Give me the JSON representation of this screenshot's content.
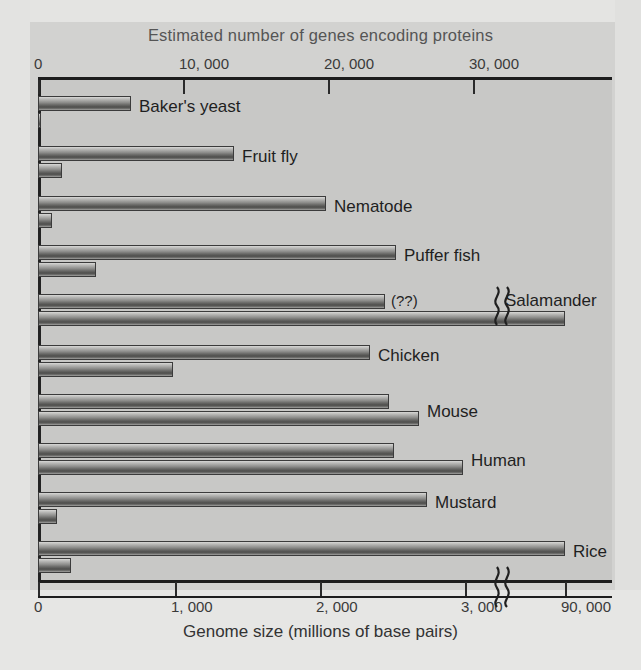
{
  "titles": {
    "top_axis_title": "Estimated number of genes encoding proteins",
    "bottom_axis_title": "Genome size (millions of base pairs)"
  },
  "chart_data": {
    "type": "bar",
    "orientation": "horizontal",
    "title": "",
    "grid": false,
    "legend": "none",
    "top_axis": {
      "label": "Estimated number of genes encoding proteins",
      "ticks": [
        "0",
        "10, 000",
        "20, 000",
        "30, 000"
      ],
      "tick_values": [
        0,
        10000,
        20000,
        30000
      ],
      "range": [
        0,
        39500
      ],
      "units": "genes"
    },
    "bottom_axis": {
      "label": "Genome size (millions of base pairs)",
      "ticks": [
        "0",
        "1, 000",
        "2, 000",
        "3, 000",
        "90, 000"
      ],
      "tick_values": [
        0,
        1000,
        2000,
        3000,
        90000
      ],
      "range": [
        0,
        3200
      ],
      "units": "millions of base pairs",
      "has_axis_break": true,
      "break_after": 3200
    },
    "categories": [
      "Baker's yeast",
      "Fruit fly",
      "Nematode",
      "Puffer fish",
      "Salamander",
      "Chicken",
      "Mouse",
      "Human",
      "Mustard",
      "Rice"
    ],
    "series": [
      {
        "name": "Estimated number of genes encoding proteins",
        "axis": "top",
        "values": [
          6400,
          13500,
          19800,
          30000,
          null,
          23000,
          24300,
          24600,
          28800,
          36300
        ]
      },
      {
        "name": "Genome size (millions of base pairs)",
        "axis": "bottom",
        "values": [
          12,
          180,
          100,
          400,
          90000,
          1000,
          2600,
          3100,
          125,
          430
        ]
      }
    ],
    "annotations": [
      {
        "text": "(??)",
        "category": "Salamander",
        "series": "Estimated number of genes encoding proteins"
      }
    ]
  },
  "rows": [
    {
      "label": "Baker's yeast",
      "genes_label": "",
      "genes_end_px": 131,
      "genome_end_px": 41,
      "y": 96
    },
    {
      "label": "Fruit fly",
      "genes_label": "",
      "genes_end_px": 234,
      "genome_end_px": 62,
      "y": 146
    },
    {
      "label": "Nematode",
      "genes_label": "",
      "genes_end_px": 326,
      "genome_end_px": 52,
      "y": 196
    },
    {
      "label": "Puffer fish",
      "genes_label": "",
      "genes_end_px": 396,
      "genome_end_px": 96,
      "y": 245
    },
    {
      "label": "Salamander",
      "genes_label": "(??)",
      "genes_end_px": 385,
      "genome_end_px": 565,
      "y": 294
    },
    {
      "label": "Chicken",
      "genes_label": "",
      "genes_end_px": 370,
      "genome_end_px": 173,
      "y": 345
    },
    {
      "label": "Mouse",
      "genes_label": "",
      "genes_end_px": 389,
      "genome_end_px": 419,
      "y": 394
    },
    {
      "label": "Human",
      "genes_label": "",
      "genes_end_px": 394,
      "genome_end_px": 463,
      "y": 443
    },
    {
      "label": "Mustard",
      "genes_label": "",
      "genes_end_px": 427,
      "genome_end_px": 57,
      "y": 492
    },
    {
      "label": "Rice",
      "genes_label": "",
      "genes_end_px": 565,
      "genome_end_px": 71,
      "y": 541
    }
  ],
  "top_ticks": [
    {
      "label": "0",
      "x": 38
    },
    {
      "label": "10, 000",
      "x": 183
    },
    {
      "label": "20, 000",
      "x": 328
    },
    {
      "label": "30, 000",
      "x": 473
    }
  ],
  "bottom_ticks": [
    {
      "label": "0",
      "x": 38
    },
    {
      "label": "1, 000",
      "x": 175
    },
    {
      "label": "2, 000",
      "x": 320
    },
    {
      "label": "3, 000",
      "x": 465
    },
    {
      "label": "90, 000",
      "x": 565
    }
  ]
}
